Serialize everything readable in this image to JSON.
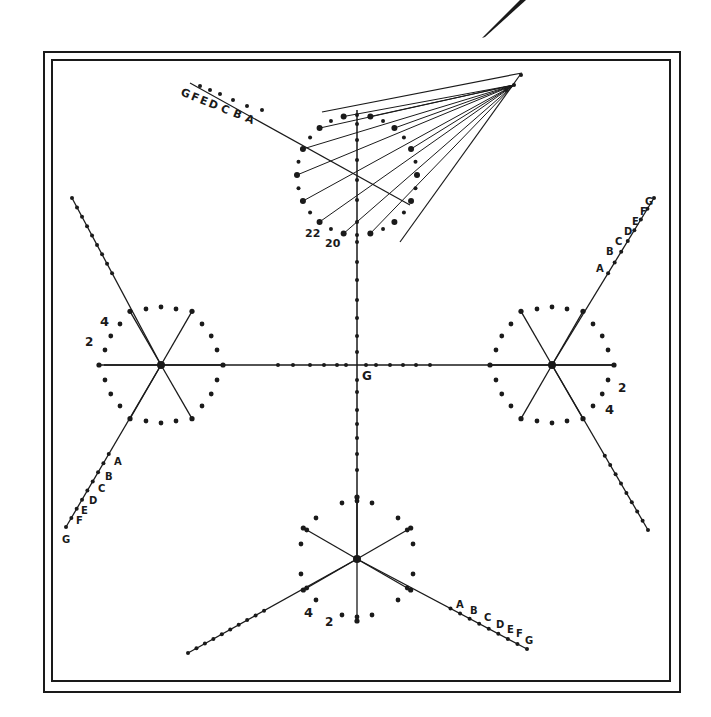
{
  "diagram": {
    "colors": {
      "ink": "#1a1a1a",
      "paper": "#ffffff"
    },
    "center_label": "G",
    "top_figure": {
      "axis_labels": [
        "G",
        "F",
        "E",
        "D",
        "C",
        "B",
        "A"
      ],
      "point_labels": [
        "22",
        "20"
      ]
    },
    "left_figure": {
      "axis_labels": [
        "A",
        "B",
        "C",
        "D",
        "E",
        "F",
        "G"
      ],
      "point_labels": [
        "4",
        "2"
      ]
    },
    "right_figure": {
      "axis_labels": [
        "A",
        "B",
        "C",
        "D",
        "E",
        "F",
        "G"
      ],
      "point_labels": [
        "2",
        "4"
      ]
    },
    "bottom_figure": {
      "axis_labels": [
        "A",
        "B",
        "C",
        "D",
        "E",
        "F",
        "G"
      ],
      "point_labels": [
        "4",
        "2"
      ]
    }
  }
}
